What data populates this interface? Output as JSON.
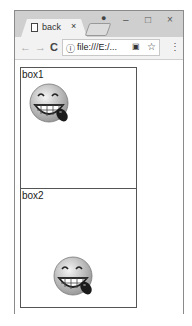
{
  "browser": {
    "tab": {
      "title": "back",
      "close": "×"
    },
    "window_controls": {
      "minimize": "–",
      "maximize": "□",
      "close": "×"
    },
    "profile_icon": "●",
    "toolbar": {
      "back": "←",
      "forward": "→",
      "reload": "C",
      "info_icon": "ⓘ",
      "url": "file:///E:/...",
      "translate_icon": "▣",
      "star_icon": "☆",
      "menu_icon": "⋮"
    }
  },
  "page": {
    "boxes": [
      {
        "label": "box1",
        "image": "grinning-emoji",
        "position": "top-left"
      },
      {
        "label": "box2",
        "image": "grinning-emoji",
        "position": "bottom-center"
      }
    ]
  }
}
